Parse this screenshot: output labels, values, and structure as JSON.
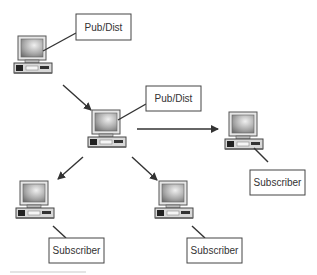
{
  "nodes": [
    {
      "id": "n1",
      "role": "publisher-distributor",
      "label": "Pub/Dist",
      "icon": "computer-icon"
    },
    {
      "id": "n2",
      "role": "publisher-distributor",
      "label": "Pub/Dist",
      "icon": "computer-icon"
    },
    {
      "id": "n3",
      "role": "subscriber",
      "label": "Subscriber",
      "icon": "computer-icon"
    },
    {
      "id": "n4",
      "role": "subscriber",
      "label": "Subscriber",
      "icon": "computer-icon"
    },
    {
      "id": "n5",
      "role": "subscriber",
      "label": "Subscriber",
      "icon": "computer-icon"
    }
  ],
  "edges": [
    {
      "from": "n1",
      "to": "n2"
    },
    {
      "from": "n2",
      "to": "n3"
    },
    {
      "from": "n2",
      "to": "n4"
    },
    {
      "from": "n2",
      "to": "n5"
    }
  ],
  "colors": {
    "line": "#333333",
    "box_border": "#444444",
    "monitor_screen": "#9a9a9a",
    "case": "#d8d8d8"
  }
}
